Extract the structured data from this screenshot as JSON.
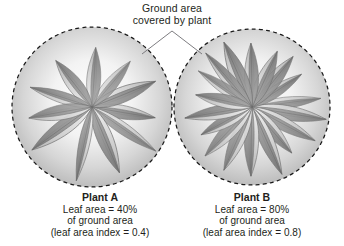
{
  "figure": {
    "title_callout": {
      "line1": "Ground area",
      "line2": "covered by plant",
      "icon": "leader-line-v"
    },
    "background_color": "#ffffff",
    "text_color": "#231f20",
    "leaf_fill_light": "#d9d9d9",
    "leaf_fill_dark": "#8a8a8a",
    "leaf_outline": "#6e6e6e",
    "circle_stroke": "#1a1a1a",
    "ground_shade": "#bdbdbd"
  },
  "panels": [
    {
      "id": "plant-a",
      "title": "Plant A",
      "line1": "Leaf area = 40%",
      "line2": "of ground area",
      "line3": "(leaf area index = 0.4)",
      "leaf_count": 11,
      "leaf_area_percent": 40,
      "leaf_area_index": 0.4,
      "circle": {
        "cx": 92,
        "cy": 107,
        "r": 80
      }
    },
    {
      "id": "plant-b",
      "title": "Plant B",
      "line1": "Leaf area = 80%",
      "line2": "of ground area",
      "line3": "(leaf area index = 0.8)",
      "leaf_count": 18,
      "leaf_area_percent": 80,
      "leaf_area_index": 0.8,
      "circle": {
        "cx": 252,
        "cy": 107,
        "r": 78
      }
    }
  ],
  "chart_data": {
    "type": "diagram",
    "title": "Ground area covered by plant",
    "categories": [
      "Plant A",
      "Plant B"
    ],
    "values": [
      40,
      80
    ],
    "ylabel": "Leaf area (% of ground area)",
    "annotations": [
      "leaf area index = 0.4",
      "leaf area index = 0.8"
    ]
  }
}
